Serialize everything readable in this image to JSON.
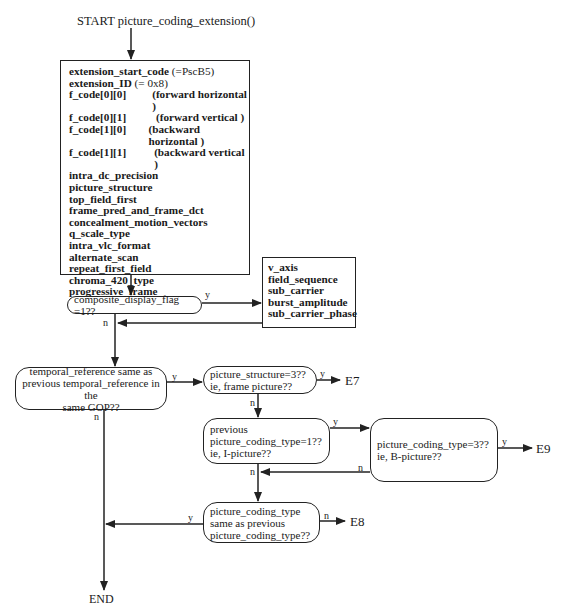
{
  "diagram": {
    "start_label": "START  picture_coding_extension()",
    "end_label": "END",
    "main_fields": [
      {
        "name": "extension_start_code",
        "value": "(=PscB5)",
        "value_bold": false,
        "inline": true
      },
      {
        "name": "extension_ID",
        "value": "(= 0x8)",
        "value_bold": false,
        "inline": true
      },
      {
        "name": "f_code[0][0]",
        "value": "(forward horizontal )",
        "value_bold": true,
        "inline": false
      },
      {
        "name": "f_code[0][1]",
        "value": "(forward vertical )",
        "value_bold": true,
        "inline": false
      },
      {
        "name": "f_code[1][0]",
        "value": "(backward horizontal )",
        "value_bold": true,
        "inline": false
      },
      {
        "name": "f_code[1][1]",
        "value": "(backward vertical )",
        "value_bold": true,
        "inline": false
      },
      {
        "name": "intra_dc_precision"
      },
      {
        "name": "picture_structure"
      },
      {
        "name": "top_field_first"
      },
      {
        "name": "frame_pred_and_frame_dct"
      },
      {
        "name": "concealment_motion_vectors"
      },
      {
        "name": "q_scale_type"
      },
      {
        "name": "intra_vlc_format"
      },
      {
        "name": "alternate_scan"
      },
      {
        "name": "repeat_first_field"
      },
      {
        "name": "chroma_420_type"
      },
      {
        "name": "progressive_frame"
      },
      {
        "name": "composite_display_flag"
      }
    ],
    "composite_fields": [
      "v_axis",
      "field_sequence",
      "sub_carrier",
      "burst_amplitude",
      "sub_carrier_phase"
    ],
    "decisions": {
      "composite": "composite_display_flag =1??",
      "temporal": [
        "temporal_reference same as",
        "previous temporal_reference in the",
        "same GOP??"
      ],
      "structure": [
        "picture_structure=3??",
        "ie, frame picture??"
      ],
      "prev_type": [
        "previous",
        "picture_coding_type=1??",
        "ie, I-picture??"
      ],
      "b_picture": [
        "picture_coding_type=3??",
        "ie, B-picture??"
      ],
      "same_type": [
        "picture_coding_type",
        "same as previous",
        "picture_coding_type??"
      ]
    },
    "branch_labels": {
      "yes": "y",
      "no": "n"
    },
    "exits": {
      "e7": "E7",
      "e8": "E8",
      "e9": "E9"
    }
  }
}
